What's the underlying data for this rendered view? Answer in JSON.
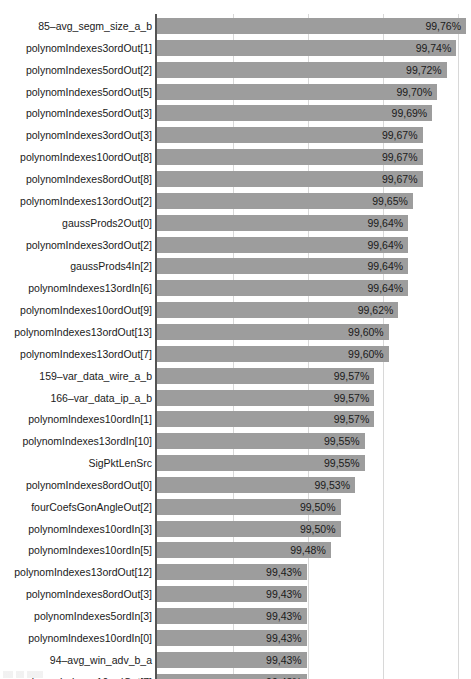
{
  "chart_data": {
    "type": "bar",
    "orientation": "horizontal",
    "title": "",
    "xlabel": "",
    "ylabel": "",
    "grid": true,
    "legend": null,
    "value_suffix": "%",
    "decimal_separator": ",",
    "xlim": [
      99.12,
      99.8
    ],
    "gridline_values": [
      99.22,
      99.32,
      99.42,
      99.52
    ],
    "bar_color": "#9d9d9d",
    "axis_color": "#555555",
    "grid_color": "#d8d8d8",
    "text_color": "#1a1a1a",
    "categories": [
      "85–avg_segm_size_a_b",
      "polynomIndexes3ordOut[1]",
      "polynomIndexes5ordOut[2]",
      "polynomIndexes5ordOut[5]",
      "polynomIndexes5ordOut[3]",
      "polynomIndexes3ordOut[3]",
      "polynomIndexes10ordOut[8]",
      "polynomIndexes8ordOut[8]",
      "polynomIndexes13ordOut[2]",
      "gaussProds2Out[0]",
      "polynomIndexes3ordOut[2]",
      "gaussProds4In[2]",
      "polynomIndexes13ordIn[6]",
      "polynomIndexes10ordOut[9]",
      "polynomIndexes13ordOut[13]",
      "polynomIndexes13ordOut[7]",
      "159–var_data_wire_a_b",
      "166–var_data_ip_a_b",
      "polynomIndexes10ordIn[1]",
      "polynomIndexes13ordIn[10]",
      "SigPktLenSrc",
      "polynomIndexes8ordOut[0]",
      "fourCoefsGonAngleOut[2]",
      "polynomIndexes10ordIn[3]",
      "polynomIndexes10ordIn[5]",
      "polynomIndexes13ordOut[12]",
      "polynomIndexes8ordOut[3]",
      "polynomIndexes5ordIn[3]",
      "polynomIndexes10ordIn[0]",
      "94–avg_win_adv_b_a",
      "polynomIndexes10ordOut[7]"
    ],
    "values": [
      99.76,
      99.74,
      99.72,
      99.7,
      99.69,
      99.67,
      99.67,
      99.67,
      99.65,
      99.64,
      99.64,
      99.64,
      99.64,
      99.62,
      99.6,
      99.6,
      99.57,
      99.57,
      99.57,
      99.55,
      99.55,
      99.53,
      99.5,
      99.5,
      99.48,
      99.43,
      99.43,
      99.43,
      99.43,
      99.43,
      99.43
    ],
    "value_labels": [
      "99,76%",
      "99,74%",
      "99,72%",
      "99,70%",
      "99,69%",
      "99,67%",
      "99,67%",
      "99,67%",
      "99,65%",
      "99,64%",
      "99,64%",
      "99,64%",
      "99,64%",
      "99,62%",
      "99,60%",
      "99,60%",
      "99,57%",
      "99,57%",
      "99,57%",
      "99,55%",
      "99,55%",
      "99,53%",
      "99,50%",
      "99,50%",
      "99,48%",
      "99,43%",
      "99,43%",
      "99,43%",
      "99,43%",
      "99,43%",
      "99,43%"
    ]
  }
}
